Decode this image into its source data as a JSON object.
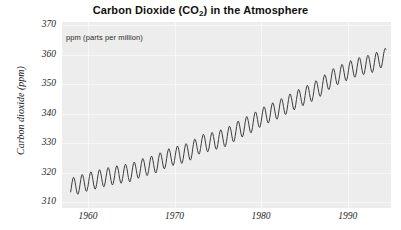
{
  "chart_data": {
    "type": "line",
    "title_main": "Carbon Dioxide (CO",
    "title_sub": "2",
    "title_tail": ") in the Atmosphere",
    "subtitle": "ppm (parts per million)",
    "xlabel": "",
    "ylabel": "Carbon dioxide (ppm)",
    "xlim": [
      1957.0,
      1995.0
    ],
    "ylim": [
      308.0,
      371.0
    ],
    "xticks": [
      1960,
      1970,
      1980,
      1990
    ],
    "xtick_labels": [
      "1960",
      "1970",
      "1980",
      "1990"
    ],
    "yticks": [
      310,
      320,
      330,
      340,
      350,
      360,
      370
    ],
    "ytick_labels": [
      "310",
      "320",
      "330",
      "340",
      "350",
      "360",
      "370"
    ],
    "grid": true,
    "legend": "none",
    "line_color": "#3d3d3d",
    "panel_color": "#ededed",
    "grid_color": "#f7f7f7",
    "series": [
      {
        "name": "Mauna Loa monthly mean CO2",
        "annual_cycle_amplitude_ppm": 6.2,
        "annual_peak_month": 5,
        "annual_trough_month": 10,
        "x": [
          1958.0,
          1959.0,
          1960.0,
          1961.0,
          1962.0,
          1963.0,
          1964.0,
          1965.0,
          1966.0,
          1967.0,
          1968.0,
          1969.0,
          1970.0,
          1971.0,
          1972.0,
          1973.0,
          1974.0,
          1975.0,
          1976.0,
          1977.0,
          1978.0,
          1979.0,
          1980.0,
          1981.0,
          1982.0,
          1983.0,
          1984.0,
          1985.0,
          1986.0,
          1987.0,
          1988.0,
          1989.0,
          1990.0,
          1991.0,
          1992.0,
          1993.0,
          1994.0
        ],
        "annual_mean_values": [
          315.0,
          315.9,
          316.9,
          317.6,
          318.4,
          319.0,
          319.6,
          320.0,
          321.4,
          322.2,
          323.1,
          324.6,
          325.7,
          326.3,
          327.5,
          329.7,
          330.2,
          331.1,
          332.0,
          333.8,
          335.4,
          336.8,
          338.7,
          340.1,
          341.4,
          343.0,
          344.6,
          346.0,
          347.4,
          349.2,
          351.6,
          353.1,
          354.4,
          355.6,
          356.4,
          357.1,
          358.8
        ]
      }
    ]
  }
}
